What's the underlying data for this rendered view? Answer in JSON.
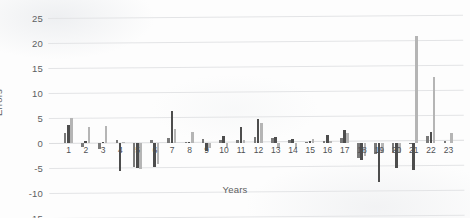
{
  "chart_data": {
    "type": "bar",
    "title": "",
    "xlabel": "Years",
    "ylabel": "Errors",
    "ylim": [
      -15,
      25
    ],
    "yticks": [
      25,
      20,
      15,
      10,
      5,
      0,
      -5,
      -10,
      -15
    ],
    "grid": true,
    "legend": "none",
    "categories": [
      "1",
      "2",
      "3",
      "4",
      "5",
      "6",
      "7",
      "8",
      "9",
      "10",
      "11",
      "12",
      "13",
      "14",
      "15",
      "16",
      "17",
      "18",
      "19",
      "20",
      "21",
      "22",
      "23"
    ],
    "series": [
      {
        "name": "Series 1",
        "color": "#7a7a7a",
        "values": [
          2.0,
          -0.8,
          -1.2,
          0.6,
          -4.8,
          0.7,
          1.0,
          0.3,
          0.8,
          0.7,
          0.6,
          1.2,
          1.1,
          0.6,
          0.2,
          0.5,
          1.0,
          -3.0,
          -2.2,
          -1.8,
          -0.2,
          1.5,
          0.5
        ]
      },
      {
        "name": "Series 2",
        "color": "#4d4d4d",
        "values": [
          3.6,
          0.4,
          0.3,
          -5.5,
          -5.0,
          -4.8,
          6.5,
          0.2,
          -1.6,
          1.4,
          3.2,
          4.8,
          1.3,
          0.9,
          0.4,
          1.6,
          2.6,
          -3.4,
          -7.7,
          -5.0,
          -5.4,
          2.2,
          0.0
        ]
      },
      {
        "name": "Series 3",
        "color": "#b5b5b5",
        "values": [
          5.0,
          3.2,
          3.4,
          0.3,
          -5.2,
          -4.2,
          2.9,
          2.2,
          -0.9,
          -0.8,
          0.6,
          4.0,
          -1.0,
          -0.9,
          0.9,
          0.4,
          2.1,
          -2.6,
          -2.0,
          -2.0,
          21.5,
          13.2,
          2.0
        ]
      }
    ]
  }
}
